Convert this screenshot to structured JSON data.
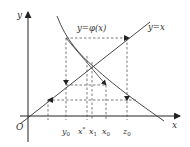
{
  "figure": {
    "axes": {
      "x_label": "x",
      "y_label": "y",
      "origin_label": "O"
    },
    "curves": [
      {
        "name": "phi",
        "label": "y=φ(x)"
      },
      {
        "name": "identity",
        "label": "y=x"
      }
    ],
    "tick_labels": {
      "y0": "y",
      "y0_sub": "0",
      "xstar": "x",
      "xstar_sup": "*",
      "x1": "x",
      "x1_sub": "1",
      "x0": "x",
      "x0_sub": "0",
      "z0": "z",
      "z0_sub": "0"
    },
    "colors": {
      "line": "#333333",
      "dashed": "#444444"
    }
  }
}
